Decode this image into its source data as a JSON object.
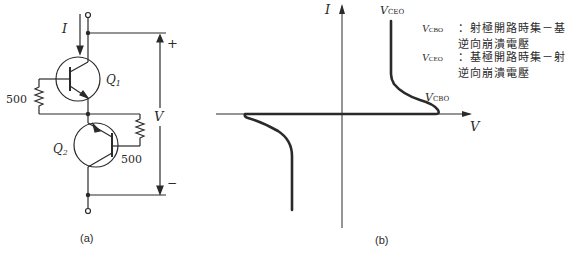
{
  "figure_a": {
    "caption": "(a)",
    "current_label": "I",
    "voltage_label": "V",
    "plus_sign": "+",
    "minus_sign": "−",
    "transistor_1": {
      "label": "Q",
      "subscript": "1"
    },
    "transistor_2": {
      "label": "Q",
      "subscript": "2"
    },
    "resistor_1": {
      "value": "500"
    },
    "resistor_2": {
      "value": "500"
    }
  },
  "figure_b": {
    "caption": "(b)",
    "y_axis_label": "I",
    "x_axis_label": "V",
    "label_top": {
      "sym": "V",
      "sub": "CEO"
    },
    "label_knee": {
      "sym": "V",
      "sub": "CBO"
    }
  },
  "legend": [
    {
      "sym": "V",
      "sub": "CBO",
      "line1": "：射極開路時集－基",
      "line2": "逆向崩潰電壓"
    },
    {
      "sym": "V",
      "sub": "CEO",
      "line1": "：基極開路時集－射",
      "line2": "逆向崩潰電壓"
    }
  ],
  "colors": {
    "ink": "#2a2a2a",
    "background": "#ffffff"
  }
}
